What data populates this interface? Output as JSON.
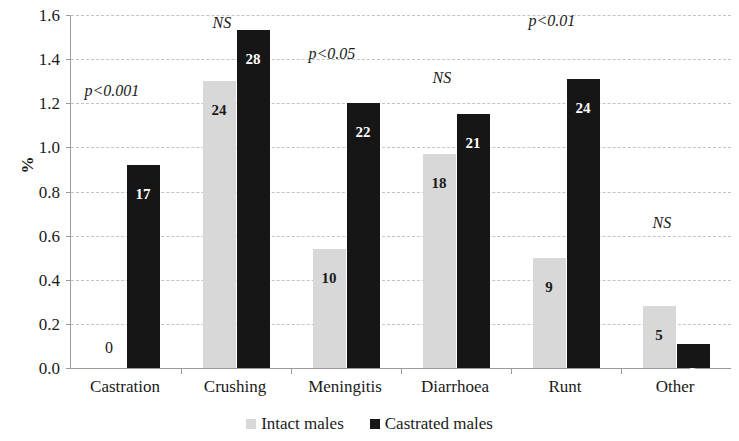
{
  "chart_data": {
    "type": "bar",
    "title": "",
    "subtitle": "",
    "xlabel": "",
    "ylabel": "%",
    "ylim": [
      0.0,
      1.6
    ],
    "y_ticks": [
      "0.0",
      "0.2",
      "0.4",
      "0.6",
      "0.8",
      "1.0",
      "1.2",
      "1.4",
      "1.6"
    ],
    "y_tick_values": [
      0.0,
      0.2,
      0.4,
      0.6,
      0.8,
      1.0,
      1.2,
      1.4,
      1.6
    ],
    "grid": true,
    "legend_position": "bottom",
    "categories": [
      "Castration",
      "Crushing",
      "Meningitis",
      "Diarrhoea",
      "Runt",
      "Other"
    ],
    "series": [
      {
        "name": "Intact males",
        "color": "#d8d8d8",
        "values": [
          0.0,
          1.3,
          0.54,
          0.97,
          0.5,
          0.28
        ],
        "labels": [
          "0",
          "24",
          "10",
          "18",
          "9",
          "5"
        ]
      },
      {
        "name": "Castrated males",
        "color": "#161616",
        "values": [
          0.92,
          1.53,
          1.2,
          1.15,
          1.31,
          0.11
        ],
        "labels": [
          "17",
          "28",
          "22",
          "21",
          "24",
          "2"
        ]
      }
    ],
    "annotations": [
      {
        "category": "Castration",
        "text": "p<0.001",
        "y": 1.255
      },
      {
        "category": "Crushing",
        "text": "NS",
        "y": 1.565
      },
      {
        "category": "Meningitis",
        "text": "p<0.05",
        "y": 1.425
      },
      {
        "category": "Diarrhoea",
        "text": "NS",
        "y": 1.315
      },
      {
        "category": "Runt",
        "text": "p<0.01",
        "y": 1.575
      },
      {
        "category": "Other",
        "text": "NS",
        "y": 0.655
      }
    ]
  },
  "legend": {
    "items": [
      {
        "label": "Intact males",
        "color": "#d8d8d8"
      },
      {
        "label": "Castrated males",
        "color": "#161616"
      }
    ]
  }
}
